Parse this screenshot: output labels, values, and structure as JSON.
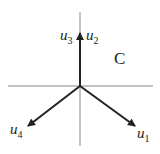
{
  "diagram": {
    "region_label": "C",
    "axes": {
      "horizontal": {
        "x1": 8,
        "y1": 86,
        "x2": 153,
        "y2": 86
      },
      "vertical": {
        "x1": 80,
        "y1": 12,
        "x2": 80,
        "y2": 146
      },
      "color": "#888888"
    },
    "vectors": [
      {
        "name": "u1",
        "base": "u",
        "sub": "1",
        "tip": [
          136,
          127
        ],
        "label_pos": [
          138,
          138
        ]
      },
      {
        "name": "u2",
        "base": "u",
        "sub": "2",
        "tip": [
          80,
          32
        ],
        "label_pos": [
          86,
          40
        ]
      },
      {
        "name": "u3",
        "base": "u",
        "sub": "3",
        "tip": [
          80,
          32
        ],
        "label_pos": [
          60,
          40
        ]
      },
      {
        "name": "u4",
        "base": "u",
        "sub": "4",
        "tip": [
          27,
          127
        ],
        "label_pos": [
          10,
          134
        ]
      }
    ],
    "vector_color": "#222222"
  }
}
